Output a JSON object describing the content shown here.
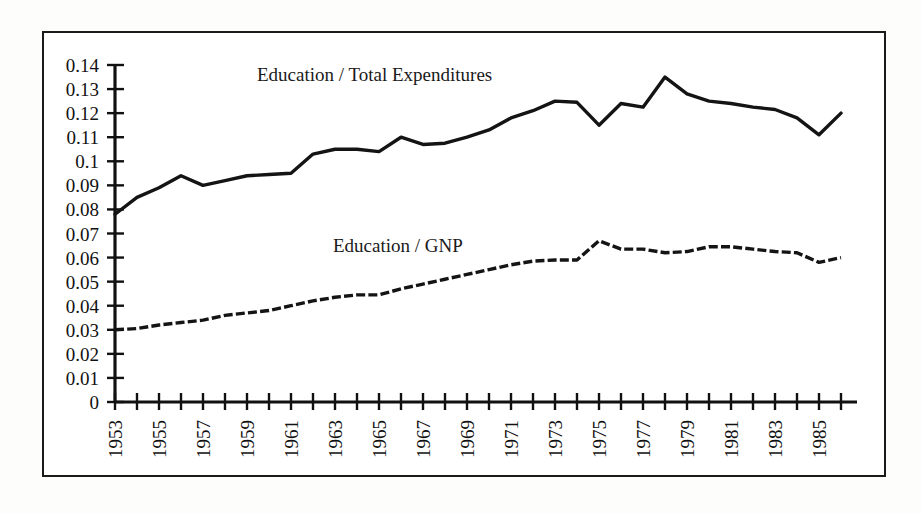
{
  "figure": {
    "background_color": "#ffffff",
    "frame_color": "#1a1a1a",
    "line_color": "#141414"
  },
  "chart_data": {
    "type": "line",
    "title": "",
    "xlabel": "",
    "ylabel": "",
    "grid": false,
    "legend_position": "inline-annotation",
    "ylim": [
      0,
      0.14
    ],
    "ytick_labels": [
      "0.14",
      "0.13",
      "0.12",
      "0.11",
      "0.1",
      "0.09",
      "0.08",
      "0.07",
      "0.06",
      "0.05",
      "0.04",
      "0.03",
      "0.02",
      "0.01",
      "0"
    ],
    "ytick_values": [
      0.14,
      0.13,
      0.12,
      0.11,
      0.1,
      0.09,
      0.08,
      0.07,
      0.06,
      0.05,
      0.04,
      0.03,
      0.02,
      0.01,
      0
    ],
    "xlim": [
      1953,
      1986
    ],
    "x": [
      1953,
      1954,
      1955,
      1956,
      1957,
      1958,
      1959,
      1960,
      1961,
      1962,
      1963,
      1964,
      1965,
      1966,
      1967,
      1968,
      1969,
      1970,
      1971,
      1972,
      1973,
      1974,
      1975,
      1976,
      1977,
      1978,
      1979,
      1980,
      1981,
      1982,
      1983,
      1984,
      1985,
      1986
    ],
    "xtick_labels": [
      "1953",
      "1955",
      "1957",
      "1959",
      "1961",
      "1963",
      "1965",
      "1967",
      "1969",
      "1971",
      "1973",
      "1975",
      "1977",
      "1979",
      "1981",
      "1983",
      "1985"
    ],
    "xtick_label_rotation": -90,
    "series": [
      {
        "name": "Education / Total Expenditures",
        "style": "solid",
        "annotation": "Education / Total Expenditures",
        "values": [
          0.078,
          0.085,
          0.089,
          0.094,
          0.09,
          0.092,
          0.094,
          0.0945,
          0.095,
          0.103,
          0.105,
          0.105,
          0.104,
          0.11,
          0.107,
          0.1075,
          0.11,
          0.113,
          0.118,
          0.121,
          0.125,
          0.1245,
          0.115,
          0.124,
          0.1225,
          0.135,
          0.128,
          0.125,
          0.124,
          0.1225,
          0.1215,
          0.118,
          0.111,
          0.12
        ]
      },
      {
        "name": "Education / GNP",
        "style": "dashed",
        "annotation": "Education / GNP",
        "values": [
          0.03,
          0.0305,
          0.032,
          0.033,
          0.034,
          0.036,
          0.037,
          0.038,
          0.04,
          0.042,
          0.0435,
          0.0445,
          0.0445,
          0.047,
          0.049,
          0.051,
          0.053,
          0.055,
          0.057,
          0.0585,
          0.059,
          0.059,
          0.067,
          0.0635,
          0.0635,
          0.062,
          0.0625,
          0.0645,
          0.0645,
          0.0635,
          0.0625,
          0.062,
          0.058,
          0.06
        ]
      }
    ]
  }
}
